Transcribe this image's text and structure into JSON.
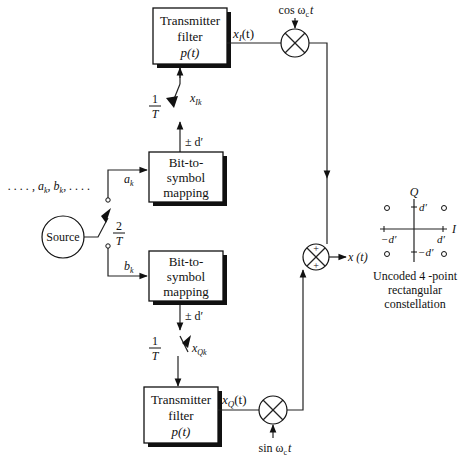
{
  "diagram": {
    "source": {
      "label": "Source"
    },
    "bit_sequence": {
      "label": ". . . . , a_k, b_k, . . . ."
    },
    "input_switch": {
      "rate_num": "2",
      "rate_den": "T"
    },
    "branch_I": {
      "input_label": "a",
      "input_sub": "k",
      "mapper": {
        "line1": "Bit-to-",
        "line2": "symbol",
        "line3": "mapping"
      },
      "level_label": "± d′",
      "switch": {
        "rate_num": "1",
        "rate_den": "T"
      },
      "sample_label": "x",
      "sample_sub": "Ik",
      "filter": {
        "line1": "Transmitter",
        "line2": "filter",
        "line3": "p(t)"
      },
      "filter_out": "x",
      "filter_out_sub": "I",
      "filter_out_arg": "(t)",
      "carrier": "cos ω",
      "carrier_sub": "c",
      "carrier_arg": "t"
    },
    "branch_Q": {
      "input_label": "b",
      "input_sub": "k",
      "mapper": {
        "line1": "Bit-to-",
        "line2": "symbol",
        "line3": "mapping"
      },
      "level_label": "± d′",
      "switch": {
        "rate_num": "1",
        "rate_den": "T"
      },
      "sample_label": "x",
      "sample_sub": "Qk",
      "filter": {
        "line1": "Transmitter",
        "line2": "filter",
        "line3": "p(t)"
      },
      "filter_out": "x",
      "filter_out_sub": "Q",
      "filter_out_arg": "(t)",
      "carrier": "sin ω",
      "carrier_sub": "c",
      "carrier_arg": "t"
    },
    "summer": {
      "top_sign": "+",
      "bottom_sign": "+"
    },
    "output": {
      "label": "x (t)"
    },
    "constellation": {
      "axis_Q": "Q",
      "axis_I": "I",
      "tick_pos_Q": "d′",
      "tick_neg_Q": "−d′",
      "tick_pos_I": "d′",
      "tick_neg_I": "−d′",
      "caption_line1": "Uncoded 4 -point",
      "caption_line2": "rectangular",
      "caption_line3": "constellation",
      "points": [
        {
          "i": -1,
          "q": 1
        },
        {
          "i": 1,
          "q": 1
        },
        {
          "i": -1,
          "q": -1
        },
        {
          "i": 1,
          "q": -1
        }
      ]
    }
  }
}
